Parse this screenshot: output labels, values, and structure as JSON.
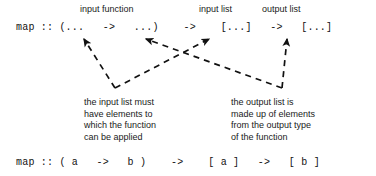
{
  "diagram": {
    "colors": {
      "background": "#ffffff",
      "text": "#1a1a1a",
      "code": "#111111",
      "arrow": "#111111"
    },
    "top_labels": [
      {
        "id": "input-function",
        "text": "input function"
      },
      {
        "id": "input-list",
        "text": "input list"
      },
      {
        "id": "output-list",
        "text": "output list"
      }
    ],
    "signature_schematic": {
      "name": "map",
      "tokens": [
        {
          "id": "name",
          "text": "map"
        },
        {
          "id": "has-type",
          "text": "::"
        },
        {
          "id": "fn-open",
          "text": "(..."
        },
        {
          "id": "fn-arrow",
          "text": "->"
        },
        {
          "id": "fn-close",
          "text": "...)"
        },
        {
          "id": "arrow-1",
          "text": "->"
        },
        {
          "id": "in-list",
          "text": "[...]"
        },
        {
          "id": "arrow-2",
          "text": "->"
        },
        {
          "id": "out-list",
          "text": "[...]"
        }
      ],
      "full_text": "map :: (...   ->   ...)    ->    [...]   ->   [...]"
    },
    "signature_concrete": {
      "full_text": "map :: ( a   ->   b )    ->    [ a ]   ->   [ b ]",
      "tokens": [
        {
          "id": "name",
          "text": "map"
        },
        {
          "id": "has-type",
          "text": "::"
        },
        {
          "id": "fn-open-paren",
          "text": "("
        },
        {
          "id": "type-a-in",
          "text": "a"
        },
        {
          "id": "fn-arrow",
          "text": "->"
        },
        {
          "id": "type-b-out",
          "text": "b"
        },
        {
          "id": "fn-close-paren",
          "text": ")"
        },
        {
          "id": "arrow-1",
          "text": "->"
        },
        {
          "id": "list-a",
          "text": "[ a ]"
        },
        {
          "id": "arrow-2",
          "text": "->"
        },
        {
          "id": "list-b",
          "text": "[ b ]"
        }
      ]
    },
    "annotations": [
      {
        "id": "input-list-note",
        "lines": [
          "the input list must",
          "have elements to",
          "which the function",
          "can be applied"
        ]
      },
      {
        "id": "output-list-note",
        "lines": [
          "the output list is",
          "made up of elements",
          "from the output type",
          "of the function"
        ]
      }
    ],
    "connectors": [
      {
        "id": "input-note-to-input-function",
        "style": "dashed",
        "arrowhead": "end"
      },
      {
        "id": "input-note-to-input-list",
        "style": "dashed",
        "arrowhead": "end"
      },
      {
        "id": "output-note-to-output-list",
        "style": "dashed",
        "arrowhead": "end"
      },
      {
        "id": "output-note-to-function-result",
        "style": "dashed",
        "arrowhead": "end"
      }
    ]
  }
}
